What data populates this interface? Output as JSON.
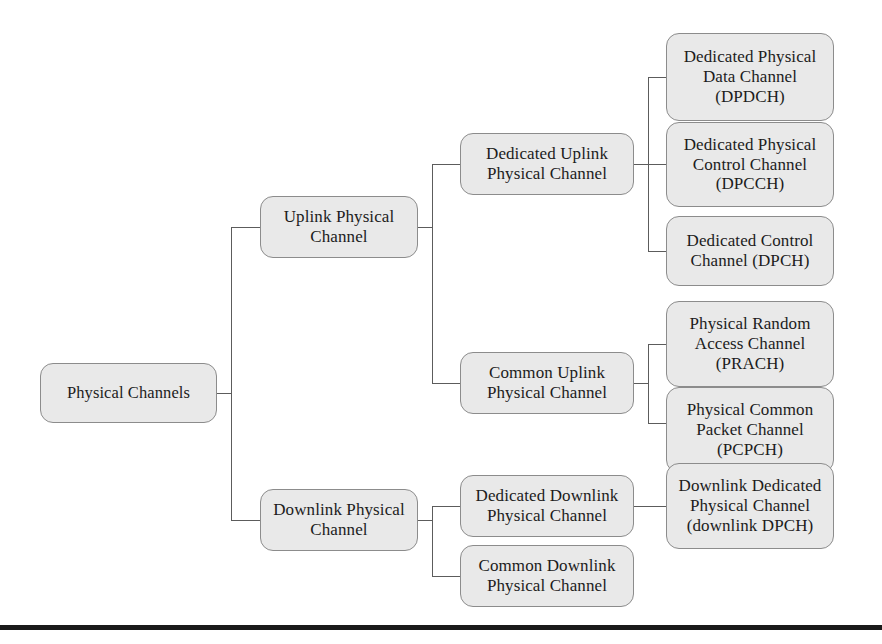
{
  "diagram": {
    "type": "tree",
    "colors": {
      "node_fill": "#e9e9e9",
      "node_border": "#8c8c8c",
      "connector": "#5c5c5c",
      "text": "#1c1c1c",
      "rule": "#1a1a1a"
    },
    "nodes": {
      "root": "Physical Channels",
      "uplink_physical_channel": "Uplink Physical\nChannel",
      "downlink_physical_channel": "Downlink Physical\nChannel",
      "dedicated_uplink_physical_channel": "Dedicated Uplink\nPhysical Channel",
      "common_uplink_physical_channel": "Common Uplink\nPhysical Channel",
      "dedicated_downlink_physical_channel": "Dedicated Downlink\nPhysical Channel",
      "common_downlink_physical_channel": "Common Downlink\nPhysical Channel",
      "dpdch": "Dedicated Physical\nData Channel\n(DPDCH)",
      "dpcch": "Dedicated Physical\nControl Channel\n(DPCCH)",
      "dpch": "Dedicated Control\nChannel (DPCH)",
      "prach": "Physical Random\nAccess Channel\n(PRACH)",
      "pcpch": "Physical Common\nPacket Channel\n(PCPCH)",
      "downlink_dpch": "Downlink Dedicated\nPhysical Channel\n(downlink DPCH)"
    }
  }
}
